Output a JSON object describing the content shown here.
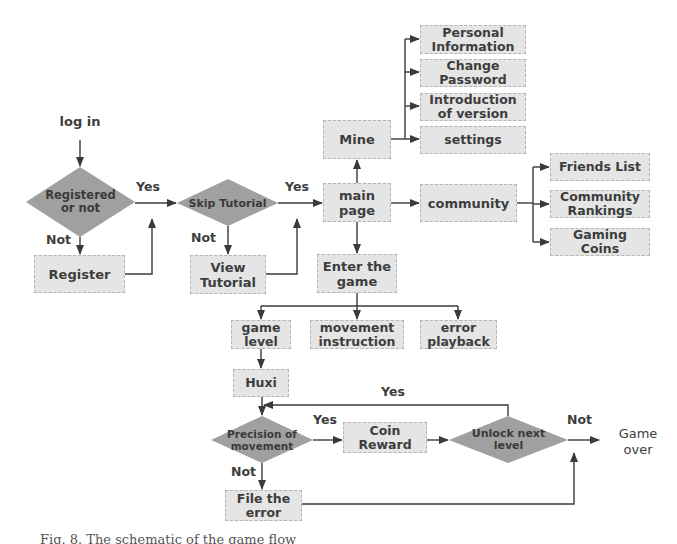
{
  "figure": {
    "type": "flowchart",
    "colors": {
      "box_fill": "#e5e5e5",
      "box_border": "#b5b5b5",
      "decision_fill": "#a0a0a0",
      "line": "#3a3a3a",
      "text": "#3d3d3d"
    }
  },
  "nodes": {
    "login": "log in",
    "registered": "Registered\nor not",
    "register": "Register",
    "skip_tutorial": "Skip Tutorial",
    "view_tutorial": "View\nTutorial",
    "mine": "Mine",
    "main_page": "main\npage",
    "enter_game": "Enter the\ngame",
    "personal_info": "Personal\nInformation",
    "change_password": "Change\nPassword",
    "introduction": "Introduction\nof version",
    "settings": "settings",
    "community": "community",
    "friends_list": "Friends List",
    "community_rankings": "Community\nRankings",
    "gaming_coins": "Gaming\nCoins",
    "game_level": "game\nlevel",
    "movement_instruction": "movement\ninstruction",
    "error_playback": "error\nplayback",
    "huxi": "Huxi",
    "precision": "Precision of\nmovement",
    "coin_reward": "Coin\nReward",
    "unlock": "Unlock next\nlevel",
    "file_error": "File the\nerror",
    "game_over": "Game\nover"
  },
  "edge_labels": {
    "registered_yes": "Yes",
    "registered_no": "Not",
    "skip_yes": "Yes",
    "skip_no": "Not",
    "precision_yes": "Yes",
    "precision_no": "Not",
    "unlock_yes": "Yes",
    "unlock_no": "Not"
  },
  "caption": "Fig. 8. The schematic of the game flow"
}
